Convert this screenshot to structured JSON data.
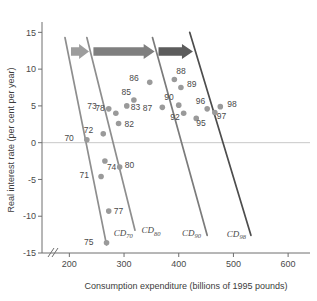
{
  "chart_data": {
    "type": "scatter",
    "title": "",
    "xlabel": "Consumption expenditure (billions of 1995 pounds)",
    "ylabel": "Real interest rate (per cent per year)",
    "xlim": [
      150,
      640
    ],
    "ylim": [
      -15,
      16
    ],
    "xticks": [
      200,
      300,
      400,
      500,
      600
    ],
    "yticks": [
      15,
      10,
      5,
      0,
      -5,
      -10,
      -15
    ],
    "xtick_labels": [
      "200",
      "300",
      "400",
      "500",
      "600"
    ],
    "ytick_labels": [
      "15",
      "10",
      "5",
      "0",
      "-5",
      "-10",
      "-15"
    ],
    "grid": false,
    "axis_break": "//",
    "zero_line": true,
    "legend": "none",
    "series": [
      {
        "name": "Consumption expenditure vs real interest rate (year observations)",
        "marker": "circle",
        "color": "#9a9a9a",
        "points": [
          {
            "label": "70",
            "x": 232,
            "y": 0.4
          },
          {
            "label": "71",
            "x": 258,
            "y": -4.6
          },
          {
            "label": "72",
            "x": 262,
            "y": 1.2
          },
          {
            "label": "73",
            "x": 272,
            "y": 4.6
          },
          {
            "label": "74",
            "x": 265,
            "y": -2.5
          },
          {
            "label": "75",
            "x": 268,
            "y": -13.6
          },
          {
            "label": "77",
            "x": 272,
            "y": -9.3
          },
          {
            "label": "78",
            "x": 285,
            "y": 4.0
          },
          {
            "label": "80",
            "x": 292,
            "y": -3.3
          },
          {
            "label": "82",
            "x": 290,
            "y": 2.6
          },
          {
            "label": "83",
            "x": 305,
            "y": 5.0
          },
          {
            "label": "85",
            "x": 318,
            "y": 5.8
          },
          {
            "label": "86",
            "x": 347,
            "y": 8.2
          },
          {
            "label": "87",
            "x": 370,
            "y": 4.8
          },
          {
            "label": "88",
            "x": 392,
            "y": 8.6
          },
          {
            "label": "89",
            "x": 404,
            "y": 7.5
          },
          {
            "label": "90",
            "x": 400,
            "y": 5.1
          },
          {
            "label": "92",
            "x": 409,
            "y": 4.0
          },
          {
            "label": "95",
            "x": 432,
            "y": 3.3
          },
          {
            "label": "96",
            "x": 452,
            "y": 4.6
          },
          {
            "label": "97",
            "x": 466,
            "y": 4.1
          },
          {
            "label": "98",
            "x": 476,
            "y": 4.9
          }
        ]
      }
    ],
    "demand_curves": [
      {
        "label": "CD",
        "sub": "70",
        "color": "#8e8e8e",
        "x_top": 192,
        "y_top": 14.3,
        "x_bot": 268,
        "y_bot": -13.9,
        "label_x": 281,
        "label_y": -12.7
      },
      {
        "label": "CD",
        "sub": "80",
        "color": "#8e8e8e",
        "x_top": 232,
        "y_top": 14.3,
        "x_bot": 320,
        "y_bot": -11.9,
        "label_x": 332,
        "label_y": -12.3
      },
      {
        "label": "CD",
        "sub": "90",
        "color": "#7b7b7b",
        "x_top": 352,
        "y_top": 14.3,
        "x_bot": 452,
        "y_bot": -12.6,
        "label_x": 406,
        "label_y": -12.7
      },
      {
        "label": "CD",
        "sub": "98",
        "color": "#4d4d4d",
        "x_top": 420,
        "y_top": 15.0,
        "x_bot": 532,
        "y_bot": -12.6,
        "label_x": 488,
        "label_y": -12.8
      }
    ],
    "shift_arrows": [
      {
        "name": "arrow-70-to-80",
        "x_start": 203,
        "x_end": 236,
        "y": 12.4,
        "color": "#9d9d9d"
      },
      {
        "name": "arrow-80-to-90",
        "x_start": 244,
        "x_end": 356,
        "y": 12.4,
        "color": "#7f7f7f"
      },
      {
        "name": "arrow-90-to-98",
        "x_start": 363,
        "x_end": 426,
        "y": 12.4,
        "color": "#5c5c5c"
      }
    ],
    "colors": {
      "marker": "#9a9a9a",
      "axis": "#6e6e6e",
      "zero_line": "#c8c8c8",
      "text": "#4a4a4a",
      "curve_light": "#8e8e8e",
      "curve_mid": "#7b7b7b",
      "curve_dark": "#4d4d4d"
    }
  }
}
